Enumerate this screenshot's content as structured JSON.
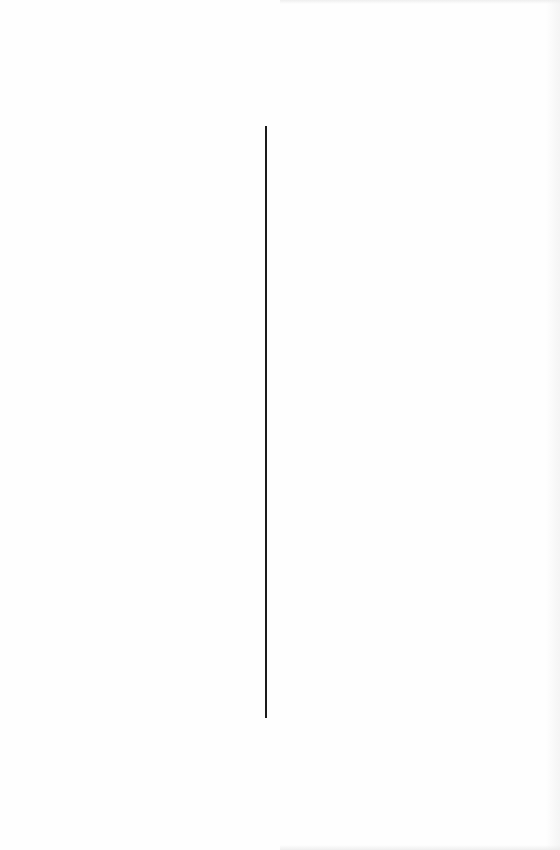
{
  "page": {
    "type": "scanned-blank-page",
    "background_color": "#fefefe",
    "vertical_rule": {
      "color": "#1a1a1a",
      "x": 266,
      "y_start": 126,
      "y_end": 718
    },
    "text": ""
  }
}
